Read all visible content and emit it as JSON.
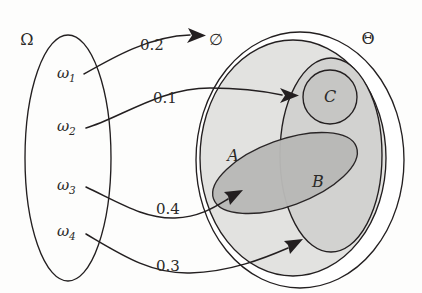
{
  "figure": {
    "ink_color": "#231f20",
    "background": "#fdfdfc"
  },
  "domain_set": {
    "label": "Ω",
    "elements": [
      {
        "id": "w1",
        "label": "ω",
        "subscript": "1"
      },
      {
        "id": "w2",
        "label": "ω",
        "subscript": "2"
      },
      {
        "id": "w3",
        "label": "ω",
        "subscript": "3"
      },
      {
        "id": "w4",
        "label": "ω",
        "subscript": "4"
      }
    ]
  },
  "codomain_set": {
    "label": "Θ",
    "empty_set_label": "∅",
    "regions": [
      {
        "id": "A",
        "label": "A",
        "shade": "#d2d2d0"
      },
      {
        "id": "B",
        "label": "B",
        "shade": "#b9b9b7"
      },
      {
        "id": "C",
        "label": "C",
        "shade": "#c6c6c4"
      }
    ]
  },
  "mappings": [
    {
      "id": "m1",
      "from": "w1",
      "to": "empty-set",
      "weight": "0.2"
    },
    {
      "id": "m2",
      "from": "w2",
      "to": "C",
      "weight": "0.1"
    },
    {
      "id": "m3",
      "from": "w3",
      "to": "A",
      "weight": "0.4"
    },
    {
      "id": "m4",
      "from": "w4",
      "to": "B",
      "weight": "0.3"
    }
  ]
}
